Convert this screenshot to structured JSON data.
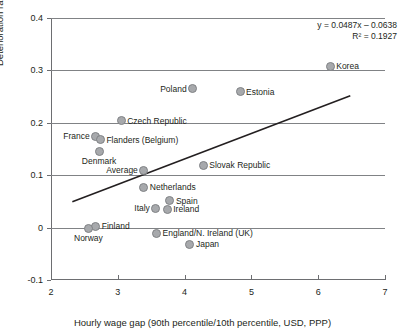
{
  "chart_data": {
    "type": "scatter",
    "title": "",
    "xlabel": "Hourly wage gap (90th percentile/10th percentile, USD, PPP)",
    "ylabel": "Deterioration rate of skills (%)",
    "xlim": [
      2,
      7
    ],
    "ylim": [
      -0.1,
      0.4
    ],
    "xticks": [
      "2",
      "3",
      "4",
      "5",
      "6",
      "7"
    ],
    "yticks": [
      "0.4",
      "0.3",
      "0.2",
      "0.1",
      "0",
      "-0.1"
    ],
    "ytick_values": [
      0.4,
      0.3,
      0.2,
      0.1,
      0,
      -0.1
    ],
    "xtick_values": [
      2,
      3,
      4,
      5,
      6,
      7
    ],
    "grid": "horizontal",
    "legend": "none",
    "marker_color": "#a7a9ac",
    "marker_edge_color": "#808285",
    "line_color": "#231f20",
    "points": [
      {
        "label": "Korea",
        "x": 6.18,
        "y": 0.308,
        "pos": "right"
      },
      {
        "label": "Poland",
        "x": 4.12,
        "y": 0.265,
        "pos": "left"
      },
      {
        "label": "Estonia",
        "x": 4.83,
        "y": 0.259,
        "pos": "right"
      },
      {
        "label": "Czech Republic",
        "x": 3.05,
        "y": 0.204,
        "pos": "right"
      },
      {
        "label": "France",
        "x": 2.67,
        "y": 0.174,
        "pos": "left"
      },
      {
        "label": "Flanders (Belgium)",
        "x": 2.74,
        "y": 0.168,
        "pos": "right"
      },
      {
        "label": "Denmark",
        "x": 2.72,
        "y": 0.146,
        "pos": "below"
      },
      {
        "label": "Average",
        "x": 3.39,
        "y": 0.109,
        "pos": "left"
      },
      {
        "label": "Slovak Republic",
        "x": 4.28,
        "y": 0.119,
        "pos": "right"
      },
      {
        "label": "Netherlands",
        "x": 3.39,
        "y": 0.077,
        "pos": "right"
      },
      {
        "label": "Spain",
        "x": 3.78,
        "y": 0.051,
        "pos": "right"
      },
      {
        "label": "Italy",
        "x": 3.57,
        "y": 0.037,
        "pos": "left"
      },
      {
        "label": "Ireland",
        "x": 3.74,
        "y": 0.035,
        "pos": "right"
      },
      {
        "label": "Finland",
        "x": 2.67,
        "y": 0.003,
        "pos": "right"
      },
      {
        "label": "Norway",
        "x": 2.56,
        "y": -0.001,
        "pos": "below"
      },
      {
        "label": "England/N. Ireland (UK)",
        "x": 3.58,
        "y": -0.011,
        "pos": "right"
      },
      {
        "label": "Japan",
        "x": 4.08,
        "y": -0.032,
        "pos": "right"
      }
    ],
    "trendline": {
      "slope": 0.0487,
      "intercept": -0.0638,
      "x_start": 2.32,
      "x_end": 6.48,
      "equation": "y = 0.0487x – 0.0638",
      "r_squared": "R² = 0.1927"
    }
  }
}
